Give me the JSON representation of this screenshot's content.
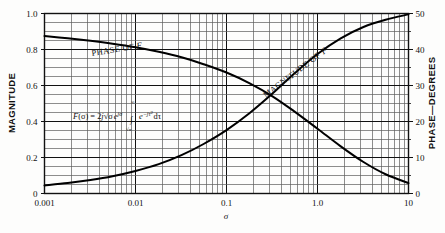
{
  "figure": {
    "background_color": "#fdfdfc",
    "ink_color": "#111111",
    "grid_color": "#5d5d5d",
    "curve_color": "#000000"
  },
  "labels": {
    "left_axis_title": "MAGNITUDE",
    "right_axis_title": "PHASE—DEGREES",
    "x_axis_symbol": "σ",
    "magnitude_curve_label": "MAGNITUDE OF ",
    "magnitude_curve_label_italic": "F",
    "phase_curve_label": "PHASE OF ",
    "phase_curve_label_italic": "F"
  },
  "formula": {
    "lhs_f": "F",
    "lhs_arg": "(σ)",
    "equals": " = 2",
    "j1": "j",
    "sqrt_sigma": "√σ",
    "exp_e": "e",
    "exp_sup": "jσ",
    "integral": "∫",
    "upper_limit": "∞",
    "lower_limit": "√σ",
    "int_e": "e",
    "int_sup_a": "−jτ",
    "int_sup_b": "2",
    "d_tau": "dτ",
    "plain": "F (σ) = 2j√σ e^{jσ} ∫ e^{−jτ²} dτ"
  },
  "chart_data": {
    "type": "line",
    "title": "",
    "xlabel": "σ",
    "ylabel": "MAGNITUDE",
    "y2label": "PHASE—DEGREES",
    "xscale": "log",
    "xlim": [
      0.001,
      10
    ],
    "ylim": [
      0,
      1.0
    ],
    "y2lim": [
      0,
      50
    ],
    "grid": true,
    "grid_minor": true,
    "legend": "inline-curve-labels",
    "x_ticks": [
      0.001,
      0.01,
      0.1,
      1.0,
      10
    ],
    "x_tick_labels": [
      "0.001",
      "0.01",
      "0.1",
      "1.0",
      "10"
    ],
    "y_ticks": [
      0,
      0.2,
      0.4,
      0.6,
      0.8,
      1.0
    ],
    "y_tick_labels": [
      "0",
      "0.2",
      "0.4",
      "0.6",
      "0.8",
      "1.0"
    ],
    "y2_ticks": [
      0,
      10,
      20,
      30,
      40,
      50
    ],
    "y2_tick_labels": [
      "0",
      "10",
      "20",
      "30",
      "40",
      "50"
    ],
    "annotations": [
      {
        "text": "F (σ) = 2j√σ e^{jσ} ∫ e^{−jτ²} dτ",
        "x": 0.012,
        "y": 0.5
      }
    ],
    "series": [
      {
        "name": "MAGNITUDE OF F",
        "axis": "left",
        "x": [
          0.001,
          0.0018,
          0.0032,
          0.0056,
          0.01,
          0.018,
          0.032,
          0.056,
          0.1,
          0.18,
          0.32,
          0.56,
          1.0,
          1.8,
          3.2,
          5.6,
          10.0
        ],
        "values": [
          0.045,
          0.058,
          0.075,
          0.096,
          0.125,
          0.163,
          0.213,
          0.275,
          0.352,
          0.447,
          0.555,
          0.668,
          0.775,
          0.862,
          0.925,
          0.965,
          0.995
        ]
      },
      {
        "name": "PHASE OF F",
        "axis": "right",
        "x": [
          0.001,
          0.0018,
          0.0032,
          0.0056,
          0.01,
          0.018,
          0.032,
          0.056,
          0.1,
          0.18,
          0.32,
          0.56,
          1.0,
          1.8,
          3.2,
          5.6,
          10.0
        ],
        "values": [
          0.875,
          0.862,
          0.848,
          0.832,
          0.812,
          0.787,
          0.757,
          0.718,
          0.672,
          0.612,
          0.54,
          0.455,
          0.36,
          0.262,
          0.175,
          0.107,
          0.058
        ],
        "values_phase_degrees": [
          43.8,
          43.1,
          42.4,
          41.6,
          40.6,
          39.4,
          37.9,
          35.9,
          33.6,
          30.6,
          27.0,
          22.8,
          18.0,
          13.1,
          8.8,
          5.4,
          2.9
        ]
      }
    ]
  }
}
